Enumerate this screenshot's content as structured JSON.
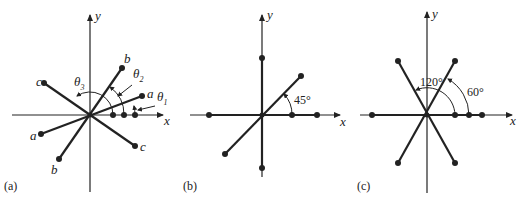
{
  "figure": {
    "panels": [
      {
        "id": "a",
        "caption": "(a)",
        "axis_x": "x",
        "axis_y": "y",
        "phasor_labels": {
          "a_pos": "a",
          "a_neg": "a",
          "b_pos": "b",
          "b_neg": "b",
          "c_pos": "c",
          "c_neg": "c"
        },
        "angles": {
          "t1": "θ",
          "t1_sub": "1",
          "t2": "θ",
          "t2_sub": "2",
          "t3": "θ",
          "t3_sub": "3"
        }
      },
      {
        "id": "b",
        "caption": "(b)",
        "axis_x": "x",
        "axis_y": "y",
        "angle_label": "45°"
      },
      {
        "id": "c",
        "caption": "(c)",
        "axis_x": "x",
        "axis_y": "y",
        "angle_label_1": "120°",
        "angle_label_2": "60°"
      }
    ]
  }
}
